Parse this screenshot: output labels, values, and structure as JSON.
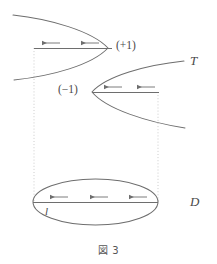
{
  "figure": {
    "caption": "図 3",
    "labels": {
      "plus_one": "(+1)",
      "minus_one": "(−1)",
      "surface_T": "T",
      "disk_D": "D",
      "line_l": "l"
    },
    "colors": {
      "stroke": "#6e6e6e",
      "text": "#4a4a4a",
      "dotted": "#bdbdbd",
      "background": "#ffffff"
    },
    "elements": [
      {
        "name": "upper-parabola",
        "type": "parabola",
        "opens": "left",
        "vertex": [
          108,
          48
        ],
        "note": "branch endpoints exit left edge"
      },
      {
        "name": "lower-parabola",
        "type": "parabola",
        "opens": "right",
        "vertex": [
          92,
          92
        ],
        "note": "branch endpoints exit right edge"
      },
      {
        "name": "upper-chord",
        "type": "segment",
        "from": [
          34,
          48
        ],
        "to": [
          112,
          48
        ],
        "arrows": 2,
        "arrow_direction": "left"
      },
      {
        "name": "middle-chord",
        "type": "segment",
        "from": [
          92,
          92
        ],
        "to": [
          158,
          92
        ],
        "arrows": 2,
        "arrow_direction": "left"
      },
      {
        "name": "disk-ellipse",
        "type": "ellipse",
        "center": [
          95.5,
          202
        ],
        "rx": 62.5,
        "ry": 23
      },
      {
        "name": "disk-chord",
        "type": "segment",
        "from": [
          33,
          202
        ],
        "to": [
          158,
          202
        ],
        "arrows": 3,
        "arrow_direction": "left"
      },
      {
        "name": "left-dotted-guide",
        "type": "dotted-vertical",
        "x": 34,
        "from_y": 48,
        "to_y": 202
      },
      {
        "name": "right-dotted-guide",
        "type": "dotted-vertical",
        "x": 158,
        "from_y": 92,
        "to_y": 202
      }
    ]
  }
}
